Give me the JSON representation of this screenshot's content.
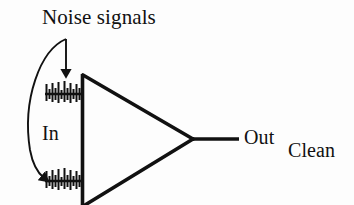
{
  "figure": {
    "kind": "amplifier-noise-rejection-diagram",
    "background_color": "#fdfdfd",
    "ink_color": "#111111"
  },
  "labels": {
    "noise_signals": "Noise signals",
    "input": "In",
    "output": "Out",
    "clean_signal_out_line1": "Clean",
    "clean_signal_out_line2": "signal",
    "clean_signal_out_line3": "out"
  },
  "diagram": {
    "amplifier": {
      "name": "amplifier-triangle",
      "apex_x": 193,
      "apex_y": 139,
      "top_left_x": 83,
      "top_left_y": 75,
      "bottom_left_x": 83,
      "bottom_left_y": 203,
      "stroke_width": 3.4
    },
    "input_bar": {
      "name": "input-vertical-bar",
      "x": 82,
      "y_top": 75,
      "y_bottom": 205,
      "stroke_width": 3.4
    },
    "output_lead": {
      "name": "output-lead",
      "x_start": 193,
      "x_end": 238,
      "y": 139,
      "stroke_width": 3.4
    },
    "noise_traces": [
      {
        "name": "upper-noise-trace",
        "baseline_y": 94,
        "x_start": 45,
        "x_end": 82,
        "spike_count": 14
      },
      {
        "name": "lower-noise-trace",
        "baseline_y": 181,
        "x_start": 45,
        "x_end": 82,
        "spike_count": 14
      }
    ],
    "straight_arrow": {
      "name": "noise-arrow-to-upper-input",
      "x": 66,
      "y_start": 39,
      "y_end": 77
    },
    "curved_arrow": {
      "name": "noise-arrow-to-lower-input",
      "start_x": 66,
      "start_y": 39,
      "end_x": 47,
      "end_y": 180
    }
  }
}
